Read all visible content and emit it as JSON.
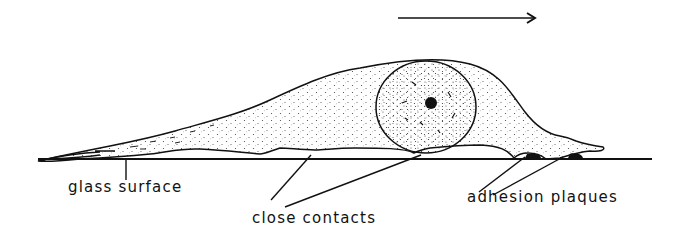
{
  "figure": {
    "type": "cell-adhesion-schematic",
    "direction_arrow": "movement-direction-right",
    "labels": {
      "glass_surface": "glass surface",
      "close_contacts": "close contacts",
      "adhesion_plaques": "adhesion plaques"
    },
    "parts": [
      "cell body",
      "nucleus",
      "nucleolus",
      "trailing tail",
      "leading lamella",
      "substrate line"
    ],
    "colors": {
      "ink": "#111111",
      "background": "#ffffff"
    }
  }
}
